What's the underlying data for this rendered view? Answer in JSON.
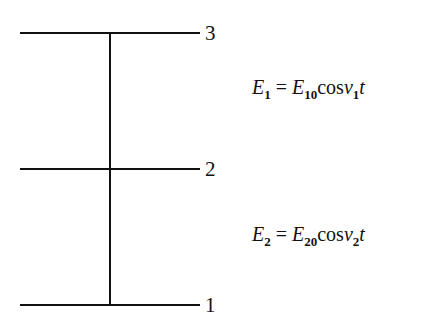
{
  "diagram": {
    "type": "energy-level-diagram",
    "levels": [
      {
        "label": "3",
        "y": 33
      },
      {
        "label": "2",
        "y": 169
      },
      {
        "label": "1",
        "y": 305
      }
    ],
    "equations": [
      {
        "lhs_var": "E",
        "lhs_sub": "1",
        "eq": "=",
        "rhs_var": "E",
        "rhs_sub": "10",
        "func": "cos",
        "freq_var": "ν",
        "freq_sub": "1",
        "t": "t"
      },
      {
        "lhs_var": "E",
        "lhs_sub": "2",
        "eq": "=",
        "rhs_var": "E",
        "rhs_sub": "20",
        "func": "cos",
        "freq_var": "ν",
        "freq_sub": "2",
        "t": "t"
      }
    ],
    "line_color": "#111111"
  }
}
